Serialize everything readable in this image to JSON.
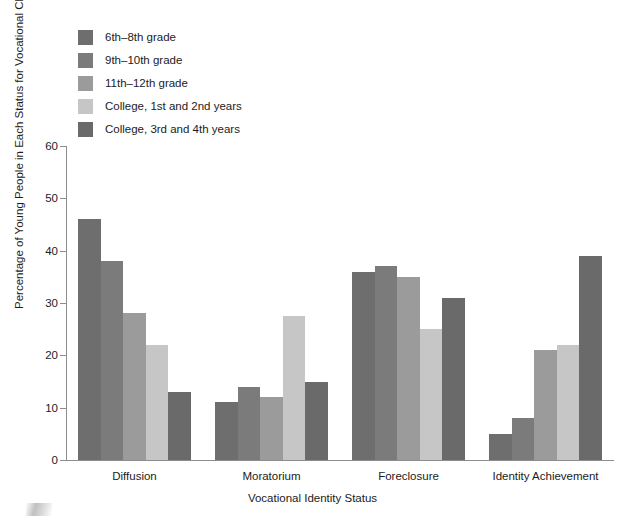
{
  "chart_data": {
    "type": "bar",
    "title": "",
    "subtitle": "",
    "xlabel": "Vocational Identity Status",
    "ylabel": "Percentage of Young People in Each Status for Vocational Choice",
    "categories": [
      "Diffusion",
      "Moratorium",
      "Foreclosure",
      "Identity Achievement"
    ],
    "series": [
      {
        "name": "6th–8th grade",
        "color": "#6e6e6e",
        "values": [
          46,
          11,
          36,
          5
        ]
      },
      {
        "name": "9th–10th grade",
        "color": "#7b7b7b",
        "values": [
          38,
          14,
          37,
          8
        ]
      },
      {
        "name": "11th–12th grade",
        "color": "#9b9b9b",
        "values": [
          28,
          12,
          35,
          21
        ]
      },
      {
        "name": "College, 1st and 2nd years",
        "color": "#c6c6c6",
        "values": [
          22,
          27.5,
          25,
          22
        ]
      },
      {
        "name": "College, 3rd and 4th years",
        "color": "#6a6a6a",
        "values": [
          13,
          15,
          31,
          39
        ]
      }
    ],
    "ylim": [
      0,
      60
    ],
    "yticks": [
      0,
      10,
      20,
      30,
      40,
      50,
      60
    ],
    "ytick_labels": [
      "0",
      "10",
      "20",
      "30",
      "40",
      "50",
      "60"
    ],
    "grid": false,
    "legend_position": "top-left"
  },
  "legend": {
    "items": [
      {
        "label": "6th–8th grade"
      },
      {
        "label": "9th–10th grade"
      },
      {
        "label": "11th–12th grade"
      },
      {
        "label": "College, 1st and 2nd years"
      },
      {
        "label": "College, 3rd and 4th years"
      }
    ]
  },
  "axes": {
    "x_title": "Vocational Identity Status",
    "y_title": "Percentage of Young People in Each Status for Vocational Choice",
    "y_tick_labels": [
      "0",
      "10",
      "20",
      "30",
      "40",
      "50",
      "60"
    ],
    "x_tick_labels": [
      "Diffusion",
      "Moratorium",
      "Foreclosure",
      "Identity Achievement"
    ]
  }
}
